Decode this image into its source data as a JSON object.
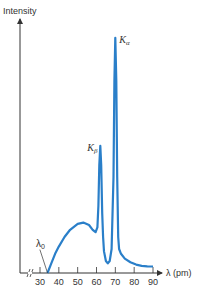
{
  "chart_data": {
    "type": "line",
    "title": "",
    "xlabel": "λ (pm)",
    "ylabel": "Intensity",
    "xlim": [
      25,
      95
    ],
    "ylim": [
      0,
      100
    ],
    "xticks": [
      30,
      40,
      50,
      60,
      70,
      80,
      90
    ],
    "xtick_labels": [
      "30",
      "40",
      "50",
      "60",
      "70",
      "80",
      "90"
    ],
    "axis_break": true,
    "grid": false,
    "series": [
      {
        "name": "X-ray spectrum",
        "color": "#2a7fc9",
        "x": [
          34,
          36,
          38,
          40,
          43,
          46,
          50,
          53,
          56,
          58,
          59.5,
          60.5,
          61,
          61.5,
          62,
          62.5,
          63,
          63.5,
          64,
          65,
          66,
          67,
          68,
          69,
          69.5,
          70,
          70.5,
          71,
          71.5,
          72,
          73,
          75,
          78,
          81,
          84,
          87,
          90
        ],
        "y": [
          0,
          4,
          8,
          11,
          15,
          18,
          20.5,
          21,
          20,
          18,
          17,
          19,
          28,
          45,
          53,
          45,
          25,
          15,
          9,
          5,
          4,
          5,
          10,
          40,
          80,
          98,
          80,
          40,
          15,
          10,
          8,
          6,
          4.5,
          3.5,
          3,
          2.8,
          2.7
        ]
      }
    ],
    "annotations": [
      {
        "text": "K",
        "subscript": "α",
        "x": 70,
        "y": 98
      },
      {
        "text": "K",
        "subscript": "β",
        "x": 62,
        "y": 53
      },
      {
        "text": "λ",
        "subscript": "0",
        "x": 34,
        "y": 0,
        "label_at": [
          31,
          11
        ]
      }
    ]
  }
}
